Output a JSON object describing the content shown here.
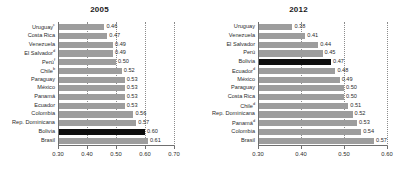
{
  "chart_data": [
    {
      "type": "bar",
      "orientation": "horizontal",
      "title": "2005",
      "xlabel": "",
      "ylabel": "",
      "xlim": [
        0.3,
        0.7
      ],
      "xticks": [
        "0.30",
        "0.40",
        "0.50",
        "0.60",
        "0.70"
      ],
      "grid": true,
      "legend": "none",
      "highlight": "Bolivia",
      "highlight_color": "#0d0d0d",
      "bar_color": "#9d9d9d",
      "categories": [
        "Uruguay",
        "Costa Rica",
        "Venezuela",
        "El Salvador",
        "Perú",
        "Chile",
        "Paraguay",
        "México",
        "Panamá",
        "Ecuador",
        "Colombia",
        "Rep. Dominicana",
        "Bolivia",
        "Brasil"
      ],
      "category_notes": [
        "c",
        "",
        "",
        "d",
        "f",
        "b",
        "",
        "",
        "",
        "",
        "",
        "",
        "",
        ""
      ],
      "values": [
        0.46,
        0.47,
        0.49,
        0.49,
        0.5,
        0.52,
        0.53,
        0.53,
        0.53,
        0.53,
        0.56,
        0.57,
        0.6,
        0.61
      ],
      "value_labels": [
        "0.46",
        "0.47",
        "0.49",
        "0.49",
        "0.50",
        "0.52",
        "0.53",
        "0.53",
        "0.53",
        "0.53",
        "0.56",
        "0.57",
        "0.60",
        "0.61"
      ]
    },
    {
      "type": "bar",
      "orientation": "horizontal",
      "title": "2012",
      "xlabel": "",
      "ylabel": "",
      "xlim": [
        0.3,
        0.6
      ],
      "xticks": [
        "0.30",
        "0.40",
        "0.50",
        "0.60"
      ],
      "grid": true,
      "legend": "none",
      "highlight": "Bolivia",
      "highlight_color": "#0d0d0d",
      "bar_color": "#9d9d9d",
      "categories": [
        "Uruguay",
        "Venezuela",
        "El Salvador",
        "Perú",
        "Bolivia",
        "Ecuador",
        "México",
        "Paraguay",
        "Costa Rica",
        "Chile",
        "Rep. Dominicana",
        "Panamá",
        "Colombia",
        "Brasil"
      ],
      "category_notes": [
        "",
        "",
        "",
        "",
        "",
        "d",
        "",
        "",
        "",
        "d",
        "",
        "d",
        "",
        ""
      ],
      "values": [
        0.38,
        0.41,
        0.44,
        0.45,
        0.47,
        0.48,
        0.49,
        0.5,
        0.5,
        0.51,
        0.52,
        0.53,
        0.54,
        0.57
      ],
      "value_labels": [
        "0.38",
        "0.41",
        "0.44",
        "0.45",
        "0.47",
        "0.48",
        "0.49",
        "0.50",
        "0.50",
        "0.51",
        "0.52",
        "0.53",
        "0.54",
        "0.57"
      ]
    }
  ]
}
